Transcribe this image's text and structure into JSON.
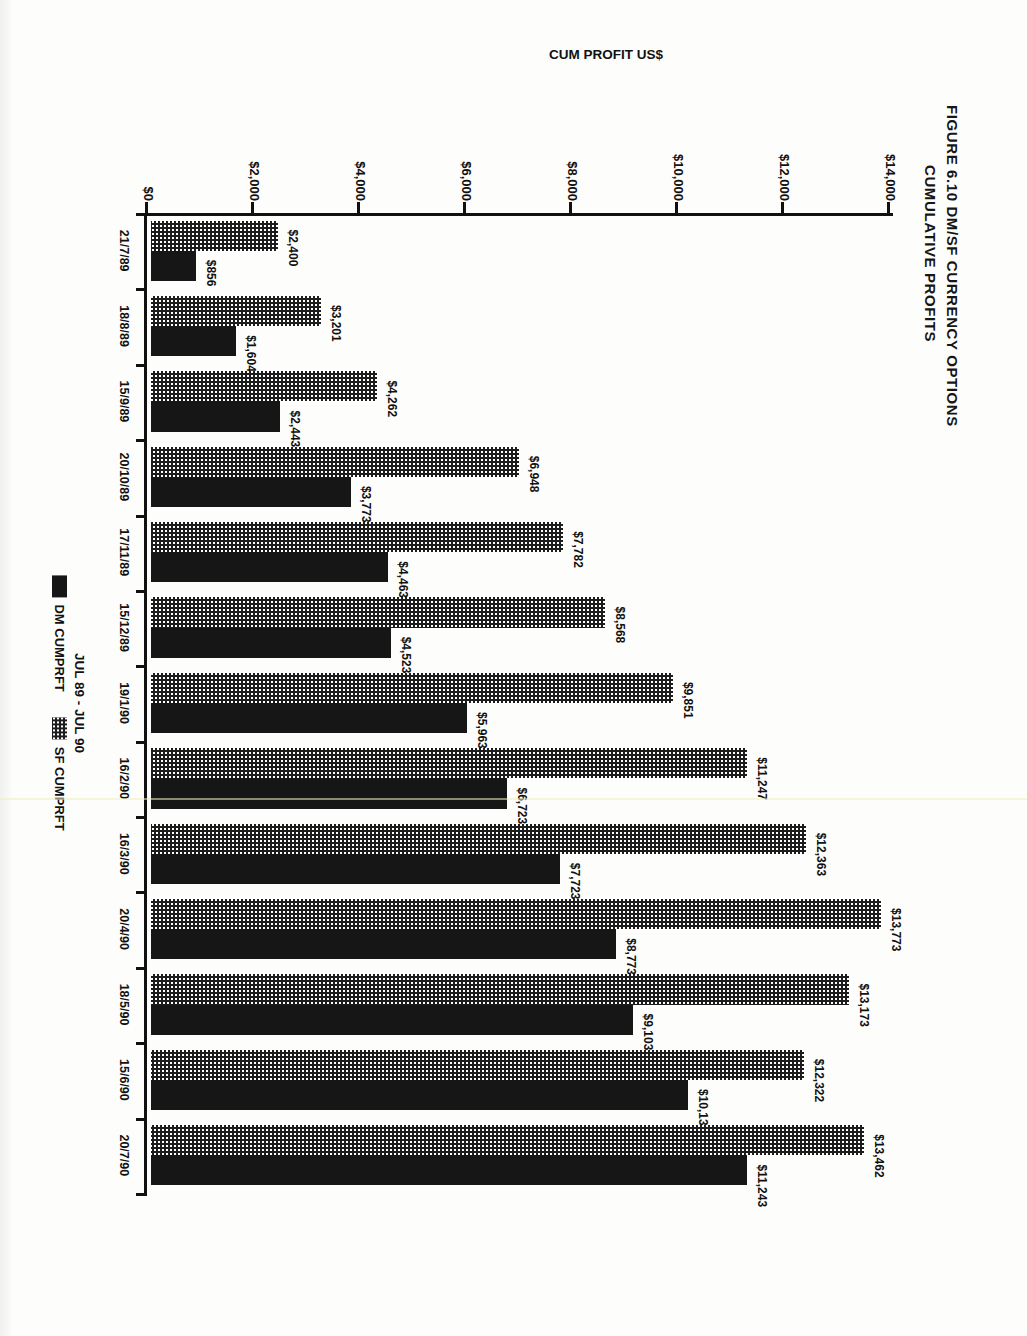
{
  "figure": {
    "title_line1": "FIGURE 6.10 DM/SF CURRENCY OPTIONS",
    "title_line2": "CUMULATIVE PROFITS"
  },
  "chart_data": {
    "type": "bar",
    "title": "FIGURE 6.10 DM/SF CURRENCY OPTIONS CUMULATIVE PROFITS",
    "xlabel": "JUL 89 - JUL 90",
    "ylabel": "CUM PROFIT US$",
    "grid": false,
    "legend_position": "bottom",
    "ylim": [
      0,
      14000
    ],
    "yticks": [
      0,
      2000,
      4000,
      6000,
      8000,
      10000,
      12000,
      14000
    ],
    "ytick_labels": [
      "$0",
      "$2,000",
      "$4,000",
      "$6,000",
      "$8,000",
      "$10,000",
      "$12,000",
      "$14,000"
    ],
    "categories": [
      "21/7/89",
      "18/8/89",
      "15/9/89",
      "20/10/89",
      "17/11/89",
      "15/12/89",
      "19/1/90",
      "16/2/90",
      "16/3/90",
      "20/4/90",
      "18/5/90",
      "15/6/90",
      "20/7/90"
    ],
    "series": [
      {
        "name": "DM CUMPRFT",
        "style": "solid-black",
        "values": [
          856,
          1604,
          2443,
          3773,
          4463,
          4523,
          5963,
          6723,
          7723,
          8773,
          9103,
          10133,
          11243
        ],
        "labels": [
          "$856",
          "$1,604",
          "$2,443",
          "$3,773",
          "$4,463",
          "$4,523",
          "$5,963",
          "$6,723",
          "$7,723",
          "$8,773",
          "$9,103",
          "$10,133",
          "$11,243"
        ]
      },
      {
        "name": "SF CUMPRFT",
        "style": "dotted-fill",
        "values": [
          2400,
          3201,
          4262,
          6948,
          7782,
          8568,
          9851,
          11247,
          12363,
          13773,
          13173,
          12322,
          13462
        ],
        "labels": [
          "$2,400",
          "$3,201",
          "$4,262",
          "$6,948",
          "$7,782",
          "$8,568",
          "$9,851",
          "$11,247",
          "$12,363",
          "$13,773",
          "$13,173",
          "$12,322",
          "$13,462"
        ]
      }
    ]
  },
  "legend": {
    "items": [
      {
        "label": "DM CUMPRFT",
        "swatch": "solid-black"
      },
      {
        "label": "SF CUMPRFT",
        "swatch": "dotted-fill"
      }
    ]
  }
}
